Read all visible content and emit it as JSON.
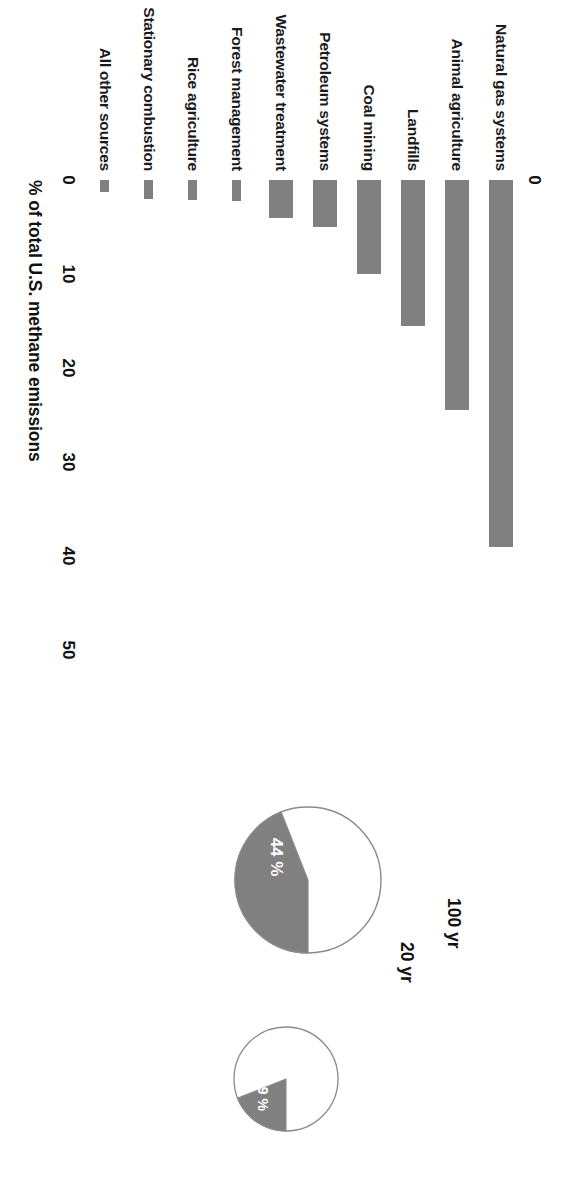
{
  "figure": {
    "title": "",
    "bar_chart": {
      "xlabel": "% of total U.S. methane emissions",
      "ticks": [
        "0",
        "10",
        "20",
        "30",
        "40",
        "50"
      ]
    },
    "pies": {
      "pie_20": {
        "caption": "20 yr",
        "slice_label": "44 %"
      },
      "pie_100": {
        "caption": "100 yr",
        "slice_label": "19 %"
      }
    }
  },
  "chart_data": [
    {
      "type": "bar",
      "orientation": "horizontal",
      "title": "",
      "xlabel": "% of total U.S. methane emissions",
      "ylabel": "",
      "xlim": [
        0,
        50
      ],
      "xticks": [
        0,
        10,
        20,
        30,
        40,
        50
      ],
      "grid": false,
      "legend": "none",
      "bar_color": "#808080",
      "categories": [
        "Natural gas systems",
        "Animal agriculture",
        "Landfills",
        "Coal mining",
        "Petroleum systems",
        "Wastewater treatment",
        "Forest management",
        "Rice agriculture",
        "Stationary combustion",
        "All other sources"
      ],
      "values": [
        39,
        24.5,
        15.5,
        10,
        5,
        4,
        2.2,
        2.1,
        2.0,
        1.3
      ]
    },
    {
      "type": "pie",
      "title": "20 yr",
      "labels": [
        "Methane share",
        "Other"
      ],
      "values": [
        44,
        56
      ],
      "data_labels": [
        "44 %",
        ""
      ],
      "colors": [
        "#808080",
        "#ffffff"
      ],
      "legend": "none"
    },
    {
      "type": "pie",
      "title": "100 yr",
      "labels": [
        "Methane share",
        "Other"
      ],
      "values": [
        19,
        81
      ],
      "data_labels": [
        "19 %",
        ""
      ],
      "colors": [
        "#808080",
        "#ffffff"
      ],
      "legend": "none"
    }
  ]
}
